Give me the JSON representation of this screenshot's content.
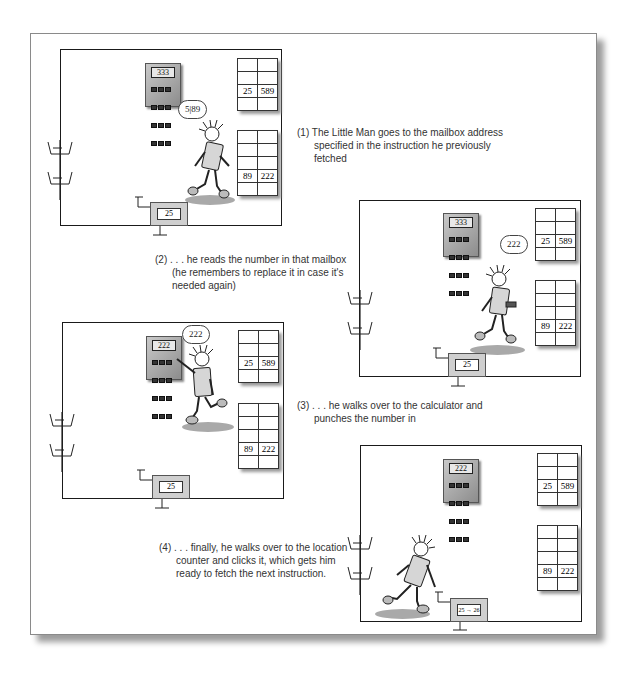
{
  "figure": {
    "panels": [
      {
        "step": 1,
        "caption": {
          "number": "(1)",
          "line1": "The Little Man goes to the mailbox address",
          "line2": "specified in the instruction he previously",
          "line3": "fetched"
        },
        "calculator_display": "333",
        "thought": "5|89",
        "mailboxes": {
          "upper": [
            "25",
            "589"
          ],
          "lower": [
            "89",
            "222"
          ]
        },
        "location_counter": "25"
      },
      {
        "step": 2,
        "caption": {
          "number": "(2)",
          "line1": ". . . he reads the number in that mailbox",
          "line2": "(he remembers to replace it in case it's",
          "line3": "needed again)"
        },
        "calculator_display": "333",
        "thought": "222",
        "mailboxes": {
          "upper": [
            "25",
            "589"
          ],
          "lower": [
            "89",
            "222"
          ]
        },
        "location_counter": "25"
      },
      {
        "step": 3,
        "caption": {
          "number": "(3)",
          "line1": ". . . he walks over to the calculator and",
          "line2": "punches the number in"
        },
        "calculator_display": "222",
        "thought": "222",
        "mailboxes": {
          "upper": [
            "25",
            "589"
          ],
          "lower": [
            "89",
            "222"
          ]
        },
        "location_counter": "25"
      },
      {
        "step": 4,
        "caption": {
          "number": "(4)",
          "line1": ". . . finally, he walks over to the location",
          "line2": "counter and clicks it, which gets him",
          "line3": "ready to fetch the next instruction."
        },
        "calculator_display": "222",
        "mailboxes": {
          "upper": [
            "25",
            "589"
          ],
          "lower": [
            "89",
            "222"
          ]
        },
        "location_counter": "25 → 26"
      }
    ]
  }
}
